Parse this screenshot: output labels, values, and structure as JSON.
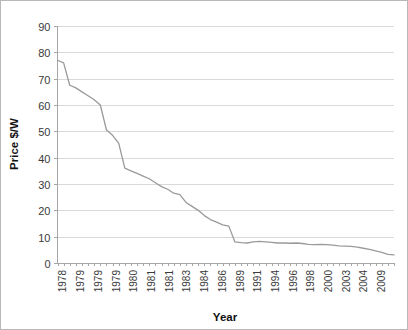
{
  "chart_data": {
    "type": "line",
    "title": "",
    "xlabel": "Year",
    "ylabel": "Price $/W",
    "ylim": [
      0,
      90
    ],
    "ytick_values": [
      0,
      10,
      20,
      30,
      40,
      50,
      60,
      70,
      80,
      90
    ],
    "ytick_labels": [
      "0",
      "10",
      "20",
      "30",
      "40",
      "50",
      "60",
      "70",
      "80",
      "90"
    ],
    "grid": "horizontal",
    "legend": "none",
    "line_color": "#9a9a9a",
    "xtick_labels": [
      "1978",
      "1979",
      "1979",
      "1979",
      "1980",
      "1981",
      "1981",
      "1983",
      "1984",
      "1986",
      "1989",
      "1991",
      "1994",
      "1996",
      "1998",
      "2000",
      "2003",
      "2004",
      "2009"
    ],
    "x": [
      "1978",
      "1978",
      "1979",
      "1979",
      "1979",
      "1979",
      "1979",
      "1979",
      "1980",
      "1980",
      "1980",
      "1981",
      "1981",
      "1981",
      "1981",
      "1981",
      "1982",
      "1983",
      "1983",
      "1984",
      "1984",
      "1985",
      "1986",
      "1986",
      "1987",
      "1988",
      "1989",
      "1989",
      "1990",
      "1991",
      "1991",
      "1992",
      "1993",
      "1994",
      "1994",
      "1995",
      "1996",
      "1996",
      "1997",
      "1998",
      "1998",
      "1999",
      "2000",
      "2000",
      "2001",
      "2002",
      "2003",
      "2003",
      "2004",
      "2004",
      "2005",
      "2006",
      "2007",
      "2008",
      "2009",
      "2009"
    ],
    "values": [
      77.0,
      76.0,
      67.5,
      66.5,
      65.0,
      63.5,
      62.0,
      60.0,
      50.5,
      48.5,
      45.5,
      36.0,
      35.0,
      34.0,
      33.0,
      32.0,
      30.5,
      29.0,
      28.0,
      26.5,
      26.0,
      23.0,
      21.5,
      20.0,
      18.0,
      16.5,
      15.5,
      14.5,
      14.0,
      8.0,
      7.7,
      7.6,
      8.0,
      8.2,
      8.0,
      7.8,
      7.6,
      7.6,
      7.5,
      7.6,
      7.4,
      7.1,
      7.0,
      7.1,
      7.0,
      6.8,
      6.5,
      6.4,
      6.3,
      6.0,
      5.6,
      5.2,
      4.6,
      4.0,
      3.3,
      3.1
    ]
  }
}
